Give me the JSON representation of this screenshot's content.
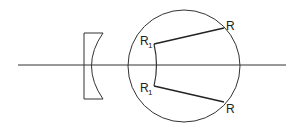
{
  "diagram": {
    "labels": {
      "r1_top": "R",
      "r1_top_sub": "1",
      "r1_bottom": "R",
      "r1_bottom_sub": "1",
      "r_top": "R",
      "r_bottom": "R"
    },
    "colors": {
      "stroke": "#333333",
      "background": "#ffffff"
    }
  }
}
